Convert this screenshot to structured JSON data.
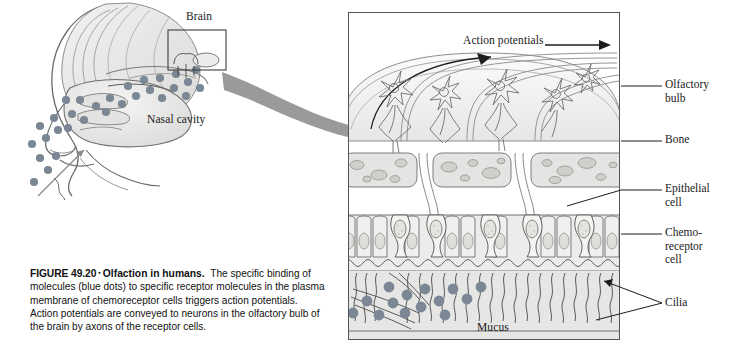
{
  "figure": {
    "number": "FIGURE 49.20",
    "bullet": "▪",
    "title": "Olfaction in humans.",
    "body": "The specific binding of molecules (blue dots) to specific receptor molecules in the plasma membrane of chemoreceptor cells triggers action potentials. Action potentials are conveyed to neurons in the olfactory bulb of the brain by axons of the receptor cells."
  },
  "head_diagram": {
    "labels": {
      "brain": "Brain",
      "nasal_cavity": "Nasal cavity"
    }
  },
  "detail_panel": {
    "labels": {
      "action_potentials": "Action potentials",
      "mucus": "Mucus"
    }
  },
  "callouts": [
    {
      "id": "olfactory-bulb",
      "line1": "Olfactory",
      "line2": "bulb",
      "line3": ""
    },
    {
      "id": "bone",
      "line1": "Bone",
      "line2": "",
      "line3": ""
    },
    {
      "id": "epithelial-cell",
      "line1": "Epithelial",
      "line2": "cell",
      "line3": ""
    },
    {
      "id": "chemoreceptor-cell",
      "line1": "Chemo-",
      "line2": "receptor",
      "line3": "cell"
    },
    {
      "id": "cilia",
      "line1": "Cilia",
      "line2": "",
      "line3": ""
    }
  ],
  "colors": {
    "odorant_dot": "#7b8794",
    "tissue_fill": "#e9e9e7",
    "bone_fill": "#e4e4e2",
    "mucus_fill": "#e2e2e0",
    "arrow_gray": "#9a9a9a",
    "outline": "#555555",
    "panel_border": "#555555",
    "text": "#1a1a1a"
  }
}
